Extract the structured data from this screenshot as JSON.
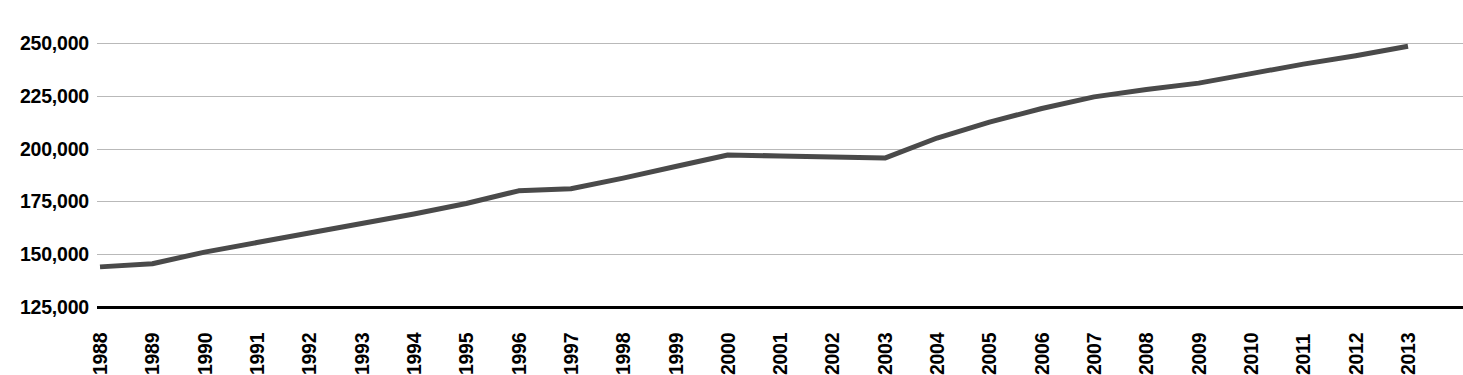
{
  "chart_data": {
    "type": "line",
    "title": "",
    "subtitle": "",
    "xlabel": "",
    "ylabel": "",
    "categories": [
      "1988",
      "1989",
      "1990",
      "1991",
      "1992",
      "1993",
      "1994",
      "1995",
      "1996",
      "1997",
      "1998",
      "1999",
      "2000",
      "2001",
      "2002",
      "2003",
      "2004",
      "2005",
      "2006",
      "2007",
      "2008",
      "2009",
      "2010",
      "2011",
      "2012",
      "2013"
    ],
    "series": [
      {
        "name": "Series 1",
        "color": "#4a4a4a",
        "values": [
          144000,
          145500,
          151000,
          155500,
          160000,
          164500,
          169000,
          174000,
          180000,
          181000,
          186000,
          191500,
          197000,
          196500,
          196000,
          195500,
          205000,
          212500,
          219000,
          224500,
          228000,
          231000,
          235500,
          240000,
          244000,
          248500
        ]
      }
    ],
    "ylim": [
      125000,
      250000
    ],
    "yticks": [
      125000,
      150000,
      175000,
      200000,
      225000,
      250000
    ],
    "ytick_labels": [
      "125,000",
      "150,000",
      "175,000",
      "200,000",
      "225,000",
      "250,000"
    ],
    "grid": true,
    "grid_axis": "y",
    "legend": false,
    "legend_position": "none",
    "annotations": []
  },
  "style": {
    "line_color": "#4a4a4a",
    "gridline_color": "#b9b9b9",
    "axis_color": "#000000",
    "background": "#ffffff",
    "text_color": "#000000"
  }
}
